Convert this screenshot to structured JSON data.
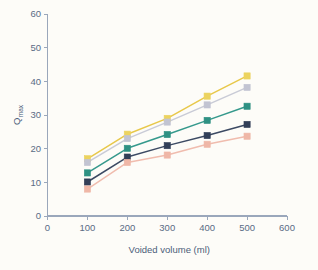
{
  "chart_data": {
    "type": "line",
    "title": "",
    "xlabel": "Voided volume (ml)",
    "ylabel": "Qmax",
    "ylabel_base": "Q",
    "ylabel_sub": "max",
    "x": [
      100,
      200,
      300,
      400,
      500
    ],
    "xlim": [
      0,
      600
    ],
    "ylim": [
      0,
      60
    ],
    "xticks": [
      0,
      100,
      200,
      300,
      400,
      500,
      600
    ],
    "yticks": [
      0,
      10,
      20,
      30,
      40,
      50,
      60
    ],
    "xtick_labels": [
      "0",
      "100",
      "200",
      "300",
      "400",
      "500",
      "600"
    ],
    "ytick_labels": [
      "0",
      "10",
      "20",
      "30",
      "40",
      "50",
      "60"
    ],
    "grid": false,
    "legend": "none",
    "marker": "square",
    "series": [
      {
        "name": "series-1-yellow",
        "color": "#e8c84a",
        "marker_color": "#ecd35f",
        "values": [
          17.0,
          24.3,
          29.0,
          35.6,
          41.6
        ]
      },
      {
        "name": "series-2-grey",
        "color": "#c9cbd6",
        "marker_color": "#c2c4d2",
        "values": [
          15.9,
          23.0,
          27.9,
          33.0,
          38.2
        ]
      },
      {
        "name": "series-3-teal",
        "color": "#35998c",
        "marker_color": "#2f9183",
        "values": [
          12.8,
          20.1,
          24.2,
          28.4,
          32.6
        ]
      },
      {
        "name": "series-4-navy",
        "color": "#3c4a63",
        "marker_color": "#323f58",
        "values": [
          10.1,
          17.5,
          20.9,
          23.9,
          27.2
        ]
      },
      {
        "name": "series-5-salmon",
        "color": "#f0bcae",
        "marker_color": "#efb7a7",
        "values": [
          8.0,
          15.9,
          18.1,
          21.3,
          23.7
        ]
      }
    ]
  },
  "colors": {
    "background": "#fdfcf8",
    "axis": "#9aa7bb",
    "tick_text": "#5a6b84",
    "axis_title": "#4b5d78"
  }
}
